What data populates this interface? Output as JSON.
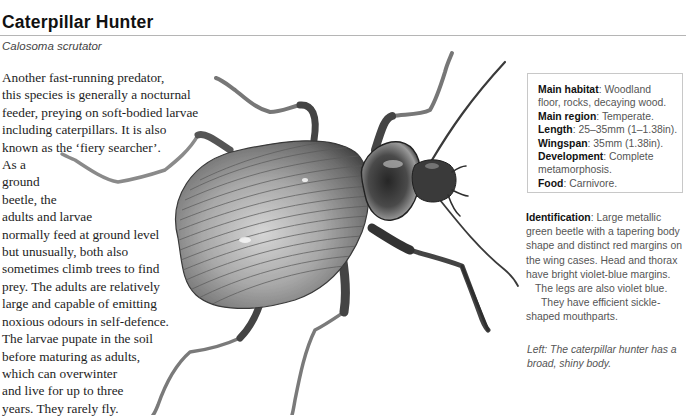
{
  "header": {
    "title": "Caterpillar Hunter",
    "scientific_name": "Calosoma scrutator"
  },
  "body_text": {
    "lines": [
      "Another fast-running predator,",
      "this species is generally a nocturnal",
      "feeder, preying on soft-bodied larvae",
      "including caterpillars. It is also",
      "known as the ‘fiery searcher’.",
      "As a",
      "ground",
      "beetle, the",
      "adults and larvae",
      "normally feed at ground level",
      "but unusually, both also",
      "sometimes climb trees to find",
      "prey. The adults are relatively",
      "large and capable of emitting",
      "noxious odours in self-defence.",
      "The larvae pupate in the soil",
      "before maturing as adults,",
      "which can overwinter",
      "and live for up to three",
      "years. They rarely fly."
    ]
  },
  "fact_box": {
    "rows": [
      {
        "label": "Main habitat",
        "value": ": Woodland"
      },
      {
        "label": "",
        "value": "floor, rocks, decaying wood."
      },
      {
        "label": "Main region",
        "value": ": Temperate."
      },
      {
        "label": "Length",
        "value": ": 25–35mm (1–1.38in)."
      },
      {
        "label": "Wingspan",
        "value": ": 35mm (1.38in)."
      },
      {
        "label": "Development",
        "value": ": Complete"
      },
      {
        "label": "",
        "value": "metamorphosis."
      },
      {
        "label": "Food",
        "value": ": Carnivore."
      }
    ]
  },
  "identification": {
    "label": "Identification",
    "lines": [
      ": Large metallic",
      "green beetle with a tapering body",
      "shape and distinct red margins on",
      "the wing cases. Head and thorax",
      "have bright violet-blue margins.",
      "The legs are also violet blue.",
      "They have efficient sickle-",
      "shaped mouthparts."
    ]
  },
  "caption": {
    "lines": [
      "Left: The caterpillar hunter has a",
      "broad, shiny body."
    ]
  },
  "image": {
    "subject": "caterpillar-hunter-beetle-illustration",
    "colors": {
      "body_light": "#c9c9c9",
      "body_mid": "#8a8a8a",
      "body_dark": "#3a3a3a",
      "leg": "#555555"
    }
  }
}
